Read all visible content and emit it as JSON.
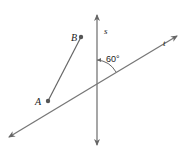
{
  "diagram": {
    "line_s": {
      "label": "s",
      "x1": 97,
      "y1": 15,
      "x2": 97,
      "y2": 145
    },
    "line_t": {
      "label": "t",
      "x1": 9,
      "y1": 137,
      "x2": 177,
      "y2": 36
    },
    "segment_AB": {
      "A": {
        "label": "A",
        "x": 48,
        "y": 101
      },
      "B": {
        "label": "B",
        "x": 81,
        "y": 37
      }
    },
    "angle": {
      "label": "60°",
      "value": 60,
      "between": [
        "s",
        "t"
      ]
    },
    "colors": {
      "line": "#777777",
      "point": "#555555",
      "text": "#222222"
    }
  }
}
